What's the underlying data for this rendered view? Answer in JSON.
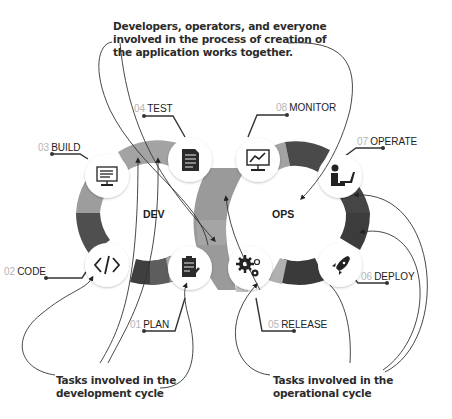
{
  "callouts": {
    "top": {
      "line1": "Developers, operators, and everyone",
      "line2": "involved in the process of creation of",
      "line3": "the application works together."
    },
    "bottom_left": {
      "line1": "Tasks involved in the",
      "line2": "development cycle"
    },
    "bottom_right": {
      "line1": "Tasks involved in the",
      "line2": "operational cycle"
    }
  },
  "cycles": {
    "dev": {
      "label": "DEV"
    },
    "ops": {
      "label": "OPS"
    }
  },
  "stages": [
    {
      "num": "01",
      "name": "PLAN",
      "icon": "clipboard-icon"
    },
    {
      "num": "02",
      "name": "CODE",
      "icon": "code-brackets-icon"
    },
    {
      "num": "03",
      "name": "BUILD",
      "icon": "monitor-document-icon"
    },
    {
      "num": "04",
      "name": "TEST",
      "icon": "checklist-document-icon"
    },
    {
      "num": "05",
      "name": "RELEASE",
      "icon": "gears-icon"
    },
    {
      "num": "06",
      "name": "DEPLOY",
      "icon": "rocket-icon"
    },
    {
      "num": "07",
      "name": "OPERATE",
      "icon": "person-laptop-icon"
    },
    {
      "num": "08",
      "name": "MONITOR",
      "icon": "monitor-chart-icon"
    }
  ],
  "colors": {
    "ring_light": "#a9a9a9",
    "ring_mid": "#8a8a8a",
    "ring_dark": "#5a5a5a",
    "ring_darkest": "#3a3a3a",
    "icon_circle": "#ffffff",
    "text": "#222222",
    "number": "#b5b5b5"
  }
}
